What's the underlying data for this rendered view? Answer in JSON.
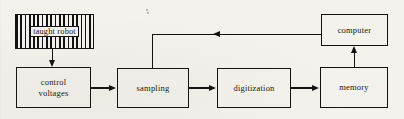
{
  "figure": {
    "type": "block-diagram",
    "title": "",
    "background_color": "#f4f2ec",
    "line_color": "#111111",
    "text_color": "#141414"
  },
  "nodes": [
    {
      "id": "taught-robot",
      "label": "taught robot",
      "fill": "hatched-vertical-stripes",
      "x": 15,
      "y": 14,
      "w": 79,
      "h": 35
    },
    {
      "id": "control-voltages",
      "label_line1": "control",
      "label_line2": "voltages",
      "label": "control voltages",
      "fill": "none",
      "x": 16,
      "y": 67,
      "w": 75,
      "h": 41
    },
    {
      "id": "sampling",
      "label": "sampling",
      "fill": "none",
      "x": 117,
      "y": 68,
      "w": 72,
      "h": 40
    },
    {
      "id": "digitization",
      "label": "digitization",
      "fill": "none",
      "x": 217,
      "y": 68,
      "w": 74,
      "h": 40
    },
    {
      "id": "memory",
      "label": "memory",
      "fill": "none",
      "x": 320,
      "y": 67,
      "w": 68,
      "h": 41
    },
    {
      "id": "computer",
      "label": "computer",
      "fill": "none",
      "x": 321,
      "y": 14,
      "w": 67,
      "h": 32
    }
  ],
  "edges": [
    {
      "id": "robot-to-control",
      "from": "taught-robot",
      "to": "control-voltages",
      "direction": "down"
    },
    {
      "id": "control-to-sampling",
      "from": "control-voltages",
      "to": "sampling",
      "direction": "right"
    },
    {
      "id": "sampling-to-digitization",
      "from": "sampling",
      "to": "digitization",
      "direction": "right"
    },
    {
      "id": "digitization-to-memory",
      "from": "digitization",
      "to": "memory",
      "direction": "right"
    },
    {
      "id": "memory-to-computer",
      "from": "memory",
      "to": "computer",
      "direction": "up"
    },
    {
      "id": "computer-to-sampling",
      "from": "computer",
      "to": "sampling",
      "direction": "left-then-down"
    }
  ]
}
